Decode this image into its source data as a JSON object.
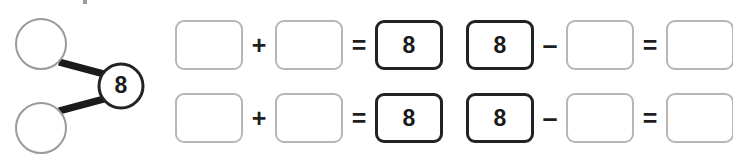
{
  "worksheet": {
    "number_bond": {
      "name": "number-bond-diagram",
      "total": "8",
      "part_top": "",
      "part_bottom": "",
      "colors": {
        "part_circle_stroke": "#9a9a9a",
        "total_circle_stroke": "#232323",
        "connector": "#1b1b1b"
      }
    },
    "equations": [
      {
        "id": "row-1-left",
        "type": "addition",
        "cells": [
          {
            "value": "",
            "style": "blank"
          },
          {
            "value": "",
            "style": "blank"
          },
          {
            "value": "8",
            "style": "filled"
          }
        ],
        "operator": "+",
        "equals": "="
      },
      {
        "id": "row-1-right",
        "type": "subtraction",
        "cells": [
          {
            "value": "8",
            "style": "filled"
          },
          {
            "value": "",
            "style": "blank"
          },
          {
            "value": "",
            "style": "blank"
          }
        ],
        "operator": "–",
        "equals": "="
      },
      {
        "id": "row-2-left",
        "type": "addition",
        "cells": [
          {
            "value": "",
            "style": "blank"
          },
          {
            "value": "",
            "style": "blank"
          },
          {
            "value": "8",
            "style": "filled"
          }
        ],
        "operator": "+",
        "equals": "="
      },
      {
        "id": "row-2-right",
        "type": "subtraction",
        "cells": [
          {
            "value": "8",
            "style": "filled"
          },
          {
            "value": "",
            "style": "blank"
          },
          {
            "value": "",
            "style": "blank"
          }
        ],
        "operator": "–",
        "equals": "="
      }
    ]
  }
}
